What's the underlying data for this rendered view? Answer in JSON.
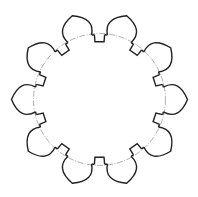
{
  "diagram": {
    "title": "",
    "type": "radial-gear-outline",
    "center": [
      99.5,
      99.5
    ],
    "pitch_circle_radius": 66,
    "tooth_count": 10,
    "notch_count": 10,
    "tip_radius": 88,
    "colors": {
      "outline": "#222222",
      "pitch_circle": "#9a9a9a",
      "background": "#ffffff"
    }
  }
}
